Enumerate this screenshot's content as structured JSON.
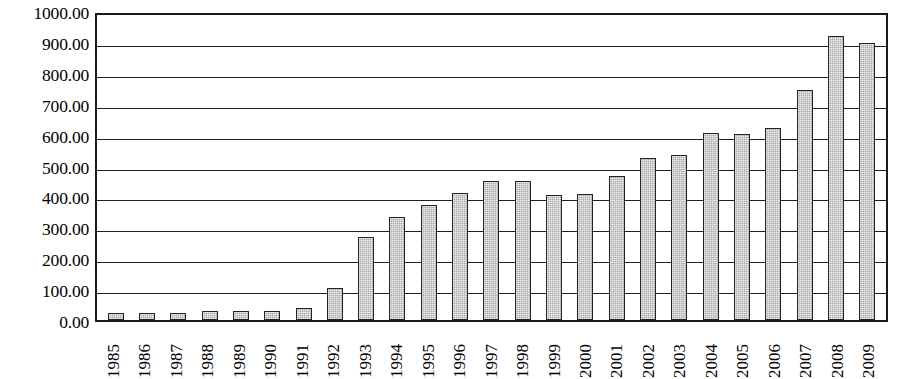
{
  "chart_data": {
    "type": "bar",
    "title": "",
    "xlabel": "",
    "ylabel": "",
    "ylim": [
      0,
      1000
    ],
    "grid": true,
    "legend": false,
    "y_ticks": [
      "0.00",
      "100.00",
      "200.00",
      "300.00",
      "400.00",
      "500.00",
      "600.00",
      "700.00",
      "800.00",
      "900.00",
      "1000.00"
    ],
    "y_tick_values": [
      0,
      100,
      200,
      300,
      400,
      500,
      600,
      700,
      800,
      900,
      1000
    ],
    "categories": [
      "1985",
      "1986",
      "1987",
      "1988",
      "1989",
      "1990",
      "1991",
      "1992",
      "1993",
      "1994",
      "1995",
      "1996",
      "1997",
      "1998",
      "1999",
      "2000",
      "2001",
      "2002",
      "2003",
      "2004",
      "2005",
      "2006",
      "2007",
      "2008",
      "2009"
    ],
    "values": [
      22,
      24,
      24,
      30,
      30,
      29,
      40,
      105,
      272,
      335,
      375,
      415,
      452,
      452,
      408,
      412,
      470,
      528,
      537,
      610,
      605,
      627,
      750,
      925,
      903
    ],
    "bar_color": "#a9a9a9",
    "bar_edge_color": "#242424",
    "axis_color": "#1a1a1a"
  },
  "axis": {
    "y_labels": [
      "1000.00",
      "900.00",
      "800.00",
      "700.00",
      "600.00",
      "500.00",
      "400.00",
      "300.00",
      "200.00",
      "100.00",
      "0.00"
    ]
  }
}
